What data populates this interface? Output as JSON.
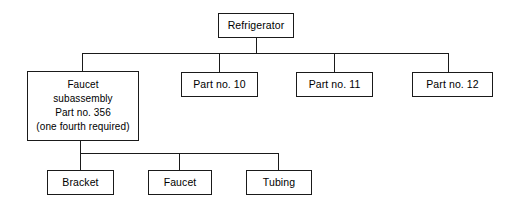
{
  "diagram": {
    "type": "bill-of-materials-tree",
    "background_color": "#ffffff",
    "line_color": "#1a1a1a",
    "text_color": "#000000",
    "nodes": {
      "root": {
        "label": "Refrigerator",
        "x": 218,
        "y": 13,
        "w": 76,
        "h": 25
      },
      "subassembly": {
        "label": "Faucet\nsubassembly\nPart no. 356\n(one fourth required)",
        "x": 27,
        "y": 71,
        "w": 112,
        "h": 70
      },
      "part10": {
        "label": "Part no. 10",
        "x": 181,
        "y": 72,
        "w": 77,
        "h": 25
      },
      "part11": {
        "label": "Part no. 11",
        "x": 296,
        "y": 72,
        "w": 77,
        "h": 25
      },
      "part12": {
        "label": "Part no. 12",
        "x": 412,
        "y": 72,
        "w": 81,
        "h": 25
      },
      "bracket": {
        "label": "Bracket",
        "x": 47,
        "y": 170,
        "w": 67,
        "h": 25
      },
      "faucet": {
        "label": "Faucet",
        "x": 148,
        "y": 170,
        "w": 64,
        "h": 25
      },
      "tubing": {
        "label": "Tubing",
        "x": 246,
        "y": 170,
        "w": 66,
        "h": 25
      }
    },
    "connectors": {
      "root_stem": {
        "x": 256,
        "y1": 38,
        "y2": 53
      },
      "upper_bus": {
        "x1": 82,
        "x2": 448,
        "y": 53
      },
      "upper_drops": [
        {
          "x": 82,
          "y1": 53,
          "y2": 71
        },
        {
          "x": 219,
          "y1": 53,
          "y2": 72
        },
        {
          "x": 334,
          "y1": 53,
          "y2": 72
        },
        {
          "x": 448,
          "y1": 53,
          "y2": 72
        }
      ],
      "sub_stem": {
        "x": 80,
        "y1": 141,
        "y2": 153
      },
      "lower_bus": {
        "x1": 80,
        "x2": 278,
        "y": 153
      },
      "lower_drops": [
        {
          "x": 80,
          "y1": 153,
          "y2": 170
        },
        {
          "x": 179,
          "y1": 153,
          "y2": 170
        },
        {
          "x": 278,
          "y1": 153,
          "y2": 170
        }
      ]
    }
  }
}
